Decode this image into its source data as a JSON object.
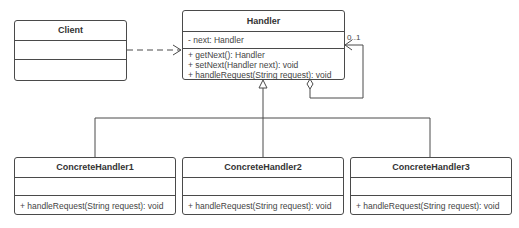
{
  "diagram": {
    "type": "UML class diagram",
    "pattern": "Chain of Responsibility",
    "classes": {
      "client": {
        "name": "Client",
        "attributes": [],
        "methods": []
      },
      "handler": {
        "name": "Handler",
        "attributes": [
          "- next: Handler"
        ],
        "methods": [
          "+ getNext(): Handler",
          "+ setNext(Handler next): void",
          "+ handleRequest(String request): void"
        ]
      },
      "concrete1": {
        "name": "ConcreteHandler1",
        "attributes": [],
        "methods": [
          "+ handleRequest(String request): void"
        ]
      },
      "concrete2": {
        "name": "ConcreteHandler2",
        "attributes": [],
        "methods": [
          "+ handleRequest(String request): void"
        ]
      },
      "concrete3": {
        "name": "ConcreteHandler3",
        "attributes": [],
        "methods": [
          "+ handleRequest(String request): void"
        ]
      }
    },
    "relations": [
      {
        "type": "dependency",
        "from": "Client",
        "to": "Handler"
      },
      {
        "type": "aggregation",
        "from": "Handler",
        "to": "Handler",
        "multiplicity": "0..1"
      },
      {
        "type": "generalization",
        "from": "ConcreteHandler1",
        "to": "Handler"
      },
      {
        "type": "generalization",
        "from": "ConcreteHandler2",
        "to": "Handler"
      },
      {
        "type": "generalization",
        "from": "ConcreteHandler3",
        "to": "Handler"
      }
    ],
    "colors": {
      "line": "#4a4a4a",
      "text": "#333333",
      "background": "#ffffff"
    }
  }
}
